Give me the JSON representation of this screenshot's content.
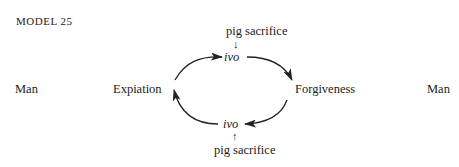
{
  "title": "MODEL 25",
  "left_label": "Man",
  "right_label": "Man",
  "nodes": {
    "left": "Expiation",
    "right": "Forgiveness",
    "top": "ivo",
    "bottom": "ivo"
  },
  "inputs": {
    "top": "pig sacrifice",
    "top_arrow": "↓",
    "bottom": "pig sacrifice",
    "bottom_arrow": "↑"
  }
}
